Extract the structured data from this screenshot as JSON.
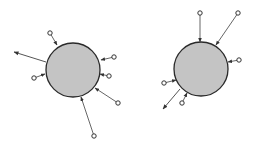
{
  "colors": {
    "background": "#ffffff",
    "body_fill": "#c4c4c4",
    "body_stroke": "#2a2a2a",
    "arrow": "#555555",
    "node_stroke": "#333333"
  },
  "diagrams": [
    {
      "id": "left",
      "body": {
        "cx": 73,
        "cy": 70,
        "r": 27
      },
      "incoming": [
        {
          "from": [
            50,
            33
          ],
          "to": [
            57,
            45
          ]
        },
        {
          "from": [
            34,
            78
          ],
          "to": [
            45,
            74
          ]
        },
        {
          "from": [
            114,
            57
          ],
          "to": [
            101,
            60
          ]
        },
        {
          "from": [
            109,
            76
          ],
          "to": [
            100,
            74
          ]
        },
        {
          "from": [
            118,
            103
          ],
          "to": [
            95,
            88
          ]
        },
        {
          "from": [
            94,
            136
          ],
          "to": [
            81,
            97
          ]
        }
      ],
      "outgoing": [
        {
          "from": [
            46,
            62
          ],
          "to": [
            14,
            52
          ]
        }
      ]
    },
    {
      "id": "right",
      "body": {
        "cx": 201,
        "cy": 69,
        "r": 27
      },
      "incoming": [
        {
          "from": [
            200,
            13
          ],
          "to": [
            200,
            42
          ]
        },
        {
          "from": [
            238,
            13
          ],
          "to": [
            216,
            45
          ]
        },
        {
          "from": [
            239,
            60
          ],
          "to": [
            228,
            62
          ]
        },
        {
          "from": [
            164,
            83
          ],
          "to": [
            176,
            80
          ]
        },
        {
          "from": [
            182,
            103
          ],
          "to": [
            187,
            93
          ]
        }
      ],
      "outgoing": [
        {
          "from": [
            180,
            89
          ],
          "to": [
            163,
            109
          ]
        }
      ]
    }
  ]
}
